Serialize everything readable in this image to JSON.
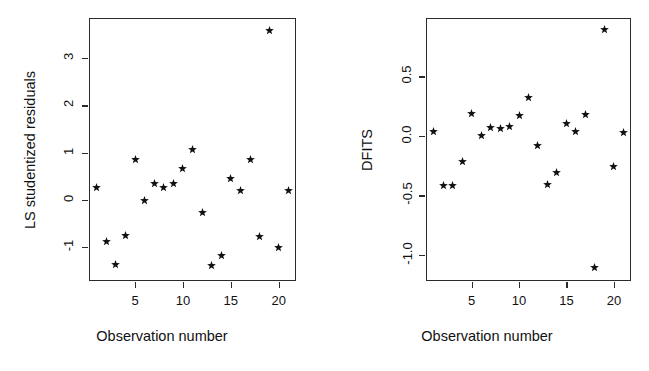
{
  "figure": {
    "background": "#ffffff",
    "foreground": "#111111",
    "marker_glyph": "*",
    "panels": 2
  },
  "chart_data": [
    {
      "type": "scatter",
      "title": "",
      "panel": "left",
      "xlabel": "Observation number",
      "ylabel": "LS studentized residuals",
      "x": [
        1,
        2,
        3,
        4,
        5,
        6,
        7,
        8,
        9,
        10,
        11,
        12,
        13,
        14,
        15,
        16,
        17,
        18,
        19,
        20,
        21
      ],
      "y": [
        0.25,
        -0.88,
        -1.38,
        -0.75,
        0.86,
        -0.02,
        0.35,
        0.27,
        0.35,
        0.67,
        1.06,
        -0.27,
        -1.4,
        -1.19,
        0.46,
        0.19,
        0.85,
        -0.77,
        3.58,
        -1.0,
        0.19
      ],
      "xticks": [
        5,
        10,
        15,
        20
      ],
      "yticks": [
        -1,
        0,
        1,
        2,
        3
      ],
      "xticklabels": [
        "5",
        "10",
        "15",
        "20"
      ],
      "yticklabels": [
        "-1",
        "0",
        "1",
        "2",
        "3"
      ],
      "xlim": [
        0.2,
        21.8
      ],
      "ylim": [
        -1.72,
        3.85
      ],
      "grid": false,
      "legend": null,
      "marker": "*"
    },
    {
      "type": "scatter",
      "title": "",
      "panel": "right",
      "xlabel": "Observation number",
      "ylabel": "DFITS",
      "x": [
        1,
        2,
        3,
        4,
        5,
        6,
        7,
        8,
        9,
        10,
        11,
        12,
        13,
        14,
        15,
        16,
        17,
        18,
        19,
        20,
        21
      ],
      "y": [
        0.04,
        -0.42,
        -0.42,
        -0.22,
        0.19,
        0.0,
        0.07,
        0.06,
        0.08,
        0.17,
        0.32,
        -0.08,
        -0.41,
        -0.31,
        0.1,
        0.04,
        0.18,
        -1.11,
        0.89,
        -0.26,
        0.03
      ],
      "xticks": [
        5,
        10,
        15,
        20
      ],
      "yticks": [
        -1.0,
        -0.5,
        0.0,
        0.5
      ],
      "xticklabels": [
        "5",
        "10",
        "15",
        "20"
      ],
      "yticklabels": [
        "-1.0",
        "-0.5",
        "0.0",
        "0.5"
      ],
      "xlim": [
        0.2,
        21.8
      ],
      "ylim": [
        -1.22,
        0.99
      ],
      "grid": false,
      "legend": null,
      "marker": "*"
    }
  ],
  "panels": {
    "left": {
      "name": "ls-studentized-residuals-plot",
      "x_axis_title": "Observation number",
      "y_axis_title": "LS studentized residuals"
    },
    "right": {
      "name": "dfits-plot",
      "x_axis_title": "Observation number",
      "y_axis_title": "DFITS"
    }
  }
}
